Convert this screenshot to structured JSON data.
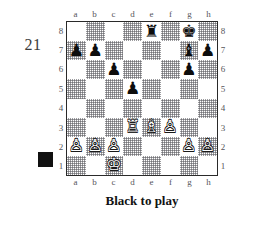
{
  "figure": {
    "number": "21",
    "caption": "Black to play",
    "side_marker": "black-square",
    "side_marker_color": "#111111"
  },
  "board": {
    "files": [
      "a",
      "b",
      "c",
      "d",
      "e",
      "f",
      "g",
      "h"
    ],
    "ranks": [
      "8",
      "7",
      "6",
      "5",
      "4",
      "3",
      "2",
      "1"
    ],
    "light_square_color": "#ffffff",
    "dark_square_color": "#8a8a8f",
    "border_color": "#2a2a2a",
    "orientation": "white-bottom",
    "coordinates_shown": [
      "top",
      "bottom",
      "left",
      "right"
    ],
    "glyphs": {
      "white_king": "♔",
      "white_queen": "♕",
      "white_rook": "♖",
      "white_bishop": "♗",
      "white_knight": "♘",
      "white_pawn": "♙",
      "black_king": "♚",
      "black_queen": "♛",
      "black_rook": "♜",
      "black_bishop": "♝",
      "black_knight": "♞",
      "black_pawn": "♟"
    },
    "position_fen": "4r1k1/pp4bp/2p3p1/3p4/8/3RBP2/PPP3PP/2K5",
    "squares": [
      [
        null,
        null,
        null,
        null,
        {
          "piece": "black_rook",
          "square": "e8"
        },
        null,
        {
          "piece": "black_king",
          "square": "g8"
        },
        null
      ],
      [
        {
          "piece": "black_pawn",
          "square": "a7"
        },
        {
          "piece": "black_pawn",
          "square": "b7"
        },
        null,
        null,
        null,
        null,
        {
          "piece": "black_bishop",
          "square": "g7"
        },
        {
          "piece": "black_pawn",
          "square": "h7"
        }
      ],
      [
        null,
        null,
        {
          "piece": "black_pawn",
          "square": "c6"
        },
        null,
        null,
        null,
        {
          "piece": "black_pawn",
          "square": "g6"
        },
        null
      ],
      [
        null,
        null,
        null,
        {
          "piece": "black_pawn",
          "square": "d5"
        },
        null,
        null,
        null,
        null
      ],
      [
        null,
        null,
        null,
        null,
        null,
        null,
        null,
        null
      ],
      [
        null,
        null,
        null,
        {
          "piece": "white_rook",
          "square": "d3"
        },
        {
          "piece": "white_bishop",
          "square": "e3"
        },
        {
          "piece": "white_pawn",
          "square": "f3"
        },
        null,
        null
      ],
      [
        {
          "piece": "white_pawn",
          "square": "a2"
        },
        {
          "piece": "white_pawn",
          "square": "b2"
        },
        {
          "piece": "white_pawn",
          "square": "c2"
        },
        null,
        null,
        null,
        {
          "piece": "white_pawn",
          "square": "g2"
        },
        {
          "piece": "white_pawn",
          "square": "h2"
        }
      ],
      [
        null,
        null,
        {
          "piece": "white_king",
          "square": "c1"
        },
        null,
        null,
        null,
        null,
        null
      ]
    ]
  }
}
